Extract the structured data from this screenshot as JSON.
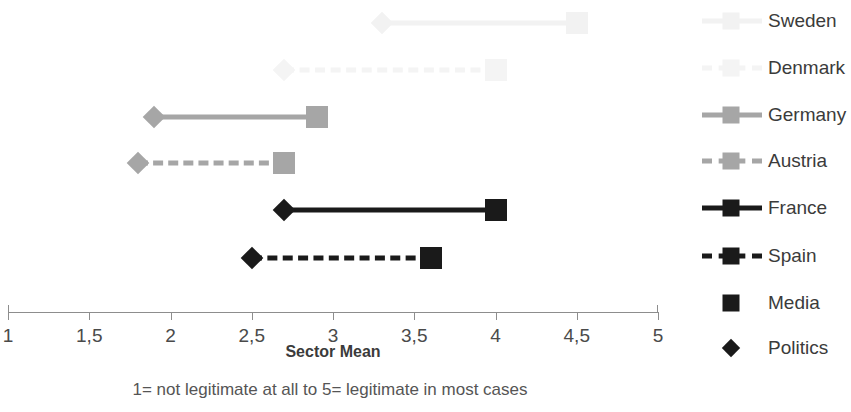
{
  "chart_data": {
    "type": "line",
    "title": "",
    "xlabel": "Sector Mean",
    "ylabel": "",
    "xlim": [
      1,
      5
    ],
    "xticks": [
      "1",
      "1,5",
      "2",
      "2,5",
      "3",
      "3,5",
      "4",
      "4,5",
      "5"
    ],
    "xtick_values": [
      1,
      1.5,
      2,
      2.5,
      3,
      3.5,
      4,
      4.5,
      5
    ],
    "grid": false,
    "legend_position": "right",
    "caption": "1= not legitimate at all to 5= legitimate in most cases",
    "point_legend": [
      {
        "label": "Media",
        "marker": "square",
        "color": "#1a1a1a"
      },
      {
        "label": "Politics",
        "marker": "diamond",
        "color": "#1a1a1a"
      }
    ],
    "series": [
      {
        "name": "Sweden",
        "style": "solid",
        "color": "#f2f2f2",
        "politics": 3.3,
        "media": 4.5
      },
      {
        "name": "Denmark",
        "style": "dashed",
        "color": "#f4f4f4",
        "politics": 2.7,
        "media": 4.0
      },
      {
        "name": "Germany",
        "style": "solid",
        "color": "#a6a6a6",
        "politics": 1.9,
        "media": 2.9
      },
      {
        "name": "Austria",
        "style": "dashed",
        "color": "#a6a6a6",
        "politics": 1.8,
        "media": 2.7
      },
      {
        "name": "France",
        "style": "solid",
        "color": "#1a1a1a",
        "politics": 2.7,
        "media": 4.0
      },
      {
        "name": "Spain",
        "style": "dashed",
        "color": "#1a1a1a",
        "politics": 2.5,
        "media": 3.6
      }
    ]
  }
}
